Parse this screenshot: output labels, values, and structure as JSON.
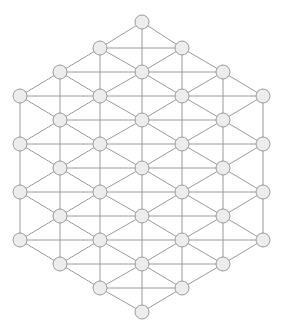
{
  "figure": {
    "background_color": "#ffffff",
    "width": 284,
    "height": 334
  },
  "graph": {
    "type": "triangular-lattice",
    "boundary_shape": "hexagon",
    "node_count": 37,
    "edge_count": 90,
    "node_style": {
      "radius": 7,
      "fill_color": "#ededed",
      "stroke_color": "#9a9a9a",
      "stroke_width": 1
    },
    "edge_style": {
      "stroke_color": "#9a9a9a",
      "stroke_width": 1
    },
    "layout": {
      "row_spacing": 24,
      "column_spacing": 81,
      "column_offset": 41,
      "even_columns_x": [
        20,
        100,
        182,
        263
      ],
      "odd_columns_x": [
        60,
        142,
        223
      ],
      "rows_y": [
        22,
        48,
        72,
        96,
        120,
        144,
        168,
        192,
        216,
        240,
        264,
        288,
        312
      ]
    },
    "nodes": [
      {
        "id": "n0",
        "x": 142,
        "y": 22,
        "label": ""
      },
      {
        "id": "n1",
        "x": 100,
        "y": 48,
        "label": ""
      },
      {
        "id": "n2",
        "x": 182,
        "y": 48,
        "label": ""
      },
      {
        "id": "n3",
        "x": 60,
        "y": 72,
        "label": ""
      },
      {
        "id": "n4",
        "x": 142,
        "y": 72,
        "label": ""
      },
      {
        "id": "n5",
        "x": 223,
        "y": 72,
        "label": ""
      },
      {
        "id": "n6",
        "x": 20,
        "y": 96,
        "label": ""
      },
      {
        "id": "n7",
        "x": 100,
        "y": 96,
        "label": ""
      },
      {
        "id": "n8",
        "x": 182,
        "y": 96,
        "label": ""
      },
      {
        "id": "n9",
        "x": 263,
        "y": 96,
        "label": ""
      },
      {
        "id": "n10",
        "x": 60,
        "y": 120,
        "label": ""
      },
      {
        "id": "n11",
        "x": 142,
        "y": 120,
        "label": ""
      },
      {
        "id": "n12",
        "x": 223,
        "y": 120,
        "label": ""
      },
      {
        "id": "n13",
        "x": 20,
        "y": 144,
        "label": ""
      },
      {
        "id": "n14",
        "x": 100,
        "y": 144,
        "label": ""
      },
      {
        "id": "n15",
        "x": 182,
        "y": 144,
        "label": ""
      },
      {
        "id": "n16",
        "x": 263,
        "y": 144,
        "label": ""
      },
      {
        "id": "n17",
        "x": 60,
        "y": 168,
        "label": ""
      },
      {
        "id": "n18",
        "x": 142,
        "y": 168,
        "label": ""
      },
      {
        "id": "n19",
        "x": 223,
        "y": 168,
        "label": ""
      },
      {
        "id": "n20",
        "x": 20,
        "y": 192,
        "label": ""
      },
      {
        "id": "n21",
        "x": 100,
        "y": 192,
        "label": ""
      },
      {
        "id": "n22",
        "x": 182,
        "y": 192,
        "label": ""
      },
      {
        "id": "n23",
        "x": 263,
        "y": 192,
        "label": ""
      },
      {
        "id": "n24",
        "x": 60,
        "y": 216,
        "label": ""
      },
      {
        "id": "n25",
        "x": 142,
        "y": 216,
        "label": ""
      },
      {
        "id": "n26",
        "x": 223,
        "y": 216,
        "label": ""
      },
      {
        "id": "n27",
        "x": 20,
        "y": 240,
        "label": ""
      },
      {
        "id": "n28",
        "x": 100,
        "y": 240,
        "label": ""
      },
      {
        "id": "n29",
        "x": 182,
        "y": 240,
        "label": ""
      },
      {
        "id": "n30",
        "x": 263,
        "y": 240,
        "label": ""
      },
      {
        "id": "n31",
        "x": 60,
        "y": 264,
        "label": ""
      },
      {
        "id": "n32",
        "x": 142,
        "y": 264,
        "label": ""
      },
      {
        "id": "n33",
        "x": 223,
        "y": 264,
        "label": ""
      },
      {
        "id": "n34",
        "x": 100,
        "y": 288,
        "label": ""
      },
      {
        "id": "n35",
        "x": 182,
        "y": 288,
        "label": ""
      },
      {
        "id": "n36",
        "x": 142,
        "y": 312,
        "label": ""
      }
    ],
    "edges": [
      [
        "n0",
        "n1"
      ],
      [
        "n0",
        "n2"
      ],
      [
        "n0",
        "n4"
      ],
      [
        "n1",
        "n2"
      ],
      [
        "n1",
        "n3"
      ],
      [
        "n1",
        "n4"
      ],
      [
        "n1",
        "n7"
      ],
      [
        "n2",
        "n4"
      ],
      [
        "n2",
        "n5"
      ],
      [
        "n2",
        "n8"
      ],
      [
        "n3",
        "n4"
      ],
      [
        "n3",
        "n6"
      ],
      [
        "n3",
        "n7"
      ],
      [
        "n3",
        "n10"
      ],
      [
        "n4",
        "n5"
      ],
      [
        "n4",
        "n7"
      ],
      [
        "n4",
        "n8"
      ],
      [
        "n4",
        "n11"
      ],
      [
        "n5",
        "n8"
      ],
      [
        "n5",
        "n9"
      ],
      [
        "n5",
        "n12"
      ],
      [
        "n6",
        "n7"
      ],
      [
        "n6",
        "n10"
      ],
      [
        "n6",
        "n13"
      ],
      [
        "n7",
        "n8"
      ],
      [
        "n7",
        "n10"
      ],
      [
        "n7",
        "n11"
      ],
      [
        "n7",
        "n14"
      ],
      [
        "n8",
        "n9"
      ],
      [
        "n8",
        "n11"
      ],
      [
        "n8",
        "n12"
      ],
      [
        "n8",
        "n15"
      ],
      [
        "n9",
        "n12"
      ],
      [
        "n9",
        "n16"
      ],
      [
        "n10",
        "n11"
      ],
      [
        "n10",
        "n13"
      ],
      [
        "n10",
        "n14"
      ],
      [
        "n10",
        "n17"
      ],
      [
        "n11",
        "n12"
      ],
      [
        "n11",
        "n14"
      ],
      [
        "n11",
        "n15"
      ],
      [
        "n11",
        "n18"
      ],
      [
        "n12",
        "n15"
      ],
      [
        "n12",
        "n16"
      ],
      [
        "n12",
        "n19"
      ],
      [
        "n13",
        "n14"
      ],
      [
        "n13",
        "n17"
      ],
      [
        "n13",
        "n20"
      ],
      [
        "n14",
        "n15"
      ],
      [
        "n14",
        "n17"
      ],
      [
        "n14",
        "n18"
      ],
      [
        "n14",
        "n21"
      ],
      [
        "n15",
        "n16"
      ],
      [
        "n15",
        "n18"
      ],
      [
        "n15",
        "n19"
      ],
      [
        "n15",
        "n22"
      ],
      [
        "n16",
        "n19"
      ],
      [
        "n16",
        "n23"
      ],
      [
        "n17",
        "n18"
      ],
      [
        "n17",
        "n20"
      ],
      [
        "n17",
        "n21"
      ],
      [
        "n17",
        "n24"
      ],
      [
        "n18",
        "n19"
      ],
      [
        "n18",
        "n21"
      ],
      [
        "n18",
        "n22"
      ],
      [
        "n18",
        "n25"
      ],
      [
        "n19",
        "n22"
      ],
      [
        "n19",
        "n23"
      ],
      [
        "n19",
        "n26"
      ],
      [
        "n20",
        "n21"
      ],
      [
        "n20",
        "n24"
      ],
      [
        "n20",
        "n27"
      ],
      [
        "n21",
        "n22"
      ],
      [
        "n21",
        "n24"
      ],
      [
        "n21",
        "n25"
      ],
      [
        "n21",
        "n28"
      ],
      [
        "n22",
        "n23"
      ],
      [
        "n22",
        "n25"
      ],
      [
        "n22",
        "n26"
      ],
      [
        "n22",
        "n29"
      ],
      [
        "n23",
        "n26"
      ],
      [
        "n23",
        "n30"
      ],
      [
        "n24",
        "n25"
      ],
      [
        "n24",
        "n27"
      ],
      [
        "n24",
        "n28"
      ],
      [
        "n24",
        "n31"
      ],
      [
        "n25",
        "n26"
      ],
      [
        "n25",
        "n28"
      ],
      [
        "n25",
        "n29"
      ],
      [
        "n25",
        "n32"
      ],
      [
        "n26",
        "n29"
      ],
      [
        "n26",
        "n30"
      ],
      [
        "n26",
        "n33"
      ],
      [
        "n27",
        "n28"
      ],
      [
        "n27",
        "n31"
      ],
      [
        "n28",
        "n29"
      ],
      [
        "n28",
        "n31"
      ],
      [
        "n28",
        "n32"
      ],
      [
        "n28",
        "n34"
      ],
      [
        "n29",
        "n30"
      ],
      [
        "n29",
        "n32"
      ],
      [
        "n29",
        "n33"
      ],
      [
        "n29",
        "n35"
      ],
      [
        "n30",
        "n33"
      ],
      [
        "n31",
        "n32"
      ],
      [
        "n31",
        "n34"
      ],
      [
        "n32",
        "n33"
      ],
      [
        "n32",
        "n34"
      ],
      [
        "n32",
        "n35"
      ],
      [
        "n32",
        "n36"
      ],
      [
        "n33",
        "n35"
      ],
      [
        "n34",
        "n35"
      ],
      [
        "n34",
        "n36"
      ],
      [
        "n35",
        "n36"
      ]
    ]
  }
}
